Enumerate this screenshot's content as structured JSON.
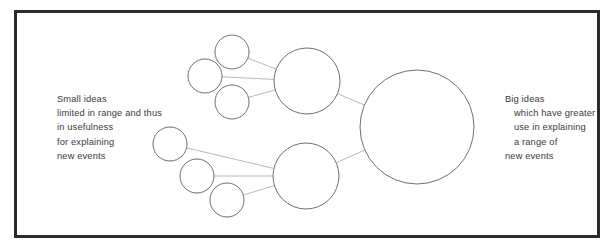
{
  "figure": {
    "frame_color": "#2b2b2b",
    "background_color": "#ffffff",
    "circle_stroke_color": "#6e6e76",
    "link_stroke_color": "#b9b9bf",
    "text_color": "#3a3a42"
  },
  "captions": {
    "left": {
      "name": "small-ideas-caption",
      "lines": [
        {
          "text": "Small ideas",
          "indented": false
        },
        {
          "text": "limited in range and thus",
          "indented": false
        },
        {
          "text": "in usefulness",
          "indented": false
        },
        {
          "text": "for explaining",
          "indented": false
        },
        {
          "text": "new events",
          "indented": false
        }
      ]
    },
    "right": {
      "name": "big-ideas-caption",
      "lines": [
        {
          "text": "Big ideas",
          "indented": false
        },
        {
          "text": "which have greater",
          "indented": true
        },
        {
          "text": "use in explaining",
          "indented": true
        },
        {
          "text": "a range of",
          "indented": true
        },
        {
          "text": "new events",
          "indented": false
        }
      ]
    }
  },
  "graph": {
    "nodes": [
      {
        "id": "s1",
        "label": "small-idea-upper-top",
        "cx": 232,
        "cy": 52,
        "r": 17,
        "group": "upper",
        "size": "small"
      },
      {
        "id": "s2",
        "label": "small-idea-upper-left",
        "cx": 205,
        "cy": 76,
        "r": 17,
        "group": "upper",
        "size": "small"
      },
      {
        "id": "s3",
        "label": "small-idea-upper-bottom",
        "cx": 232,
        "cy": 102,
        "r": 17,
        "group": "upper",
        "size": "small"
      },
      {
        "id": "m1",
        "label": "medium-idea-upper",
        "cx": 307,
        "cy": 81,
        "r": 33,
        "group": "upper",
        "size": "medium"
      },
      {
        "id": "s4",
        "label": "small-idea-lower-top",
        "cx": 170,
        "cy": 144,
        "r": 17,
        "group": "lower",
        "size": "small"
      },
      {
        "id": "s5",
        "label": "small-idea-lower-middle",
        "cx": 197,
        "cy": 176,
        "r": 17,
        "group": "lower",
        "size": "small"
      },
      {
        "id": "s6",
        "label": "small-idea-lower-bottom",
        "cx": 227,
        "cy": 200,
        "r": 17,
        "group": "lower",
        "size": "small"
      },
      {
        "id": "m2",
        "label": "medium-idea-lower",
        "cx": 306,
        "cy": 176,
        "r": 33,
        "group": "lower",
        "size": "medium"
      },
      {
        "id": "b1",
        "label": "big-idea",
        "cx": 417,
        "cy": 127,
        "r": 57,
        "group": "big",
        "size": "large"
      }
    ],
    "edges": [
      {
        "from": "s1",
        "to": "m1",
        "name": "link-upper-top-to-medium"
      },
      {
        "from": "s2",
        "to": "m1",
        "name": "link-upper-left-to-medium"
      },
      {
        "from": "s3",
        "to": "m1",
        "name": "link-upper-bottom-to-medium"
      },
      {
        "from": "m1",
        "to": "b1",
        "name": "link-upper-medium-to-big"
      },
      {
        "from": "s4",
        "to": "m2",
        "name": "link-lower-top-to-medium"
      },
      {
        "from": "s5",
        "to": "m2",
        "name": "link-lower-middle-to-medium"
      },
      {
        "from": "s6",
        "to": "m2",
        "name": "link-lower-bottom-to-medium"
      },
      {
        "from": "m2",
        "to": "b1",
        "name": "link-lower-medium-to-big"
      }
    ]
  }
}
